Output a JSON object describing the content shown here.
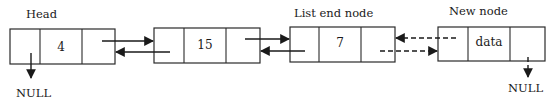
{
  "diagram": {
    "type": "doubly-linked-list-insertion",
    "labels": {
      "head": "Head",
      "list_end": "List end node",
      "new_node": "New node",
      "null_left": "NULL",
      "null_right": "NULL"
    },
    "nodes": [
      {
        "id": "node-1",
        "value": "4",
        "role": "head"
      },
      {
        "id": "node-2",
        "value": "15",
        "role": "middle"
      },
      {
        "id": "node-3",
        "value": "7",
        "role": "list-end"
      },
      {
        "id": "node-4",
        "value": "data",
        "role": "new-node"
      }
    ],
    "links": [
      {
        "from": "node-1",
        "to": "node-2",
        "kind": "next",
        "style": "solid"
      },
      {
        "from": "node-2",
        "to": "node-1",
        "kind": "prev",
        "style": "solid"
      },
      {
        "from": "node-2",
        "to": "node-3",
        "kind": "next",
        "style": "solid"
      },
      {
        "from": "node-3",
        "to": "node-2",
        "kind": "prev",
        "style": "solid"
      },
      {
        "from": "node-3",
        "to": "node-4",
        "kind": "next",
        "style": "dashed"
      },
      {
        "from": "node-4",
        "to": "node-3",
        "kind": "prev",
        "style": "dashed"
      },
      {
        "from": "node-1",
        "to": "NULL",
        "kind": "prev",
        "style": "solid"
      },
      {
        "from": "node-4",
        "to": "NULL",
        "kind": "next",
        "style": "dashed"
      }
    ]
  }
}
